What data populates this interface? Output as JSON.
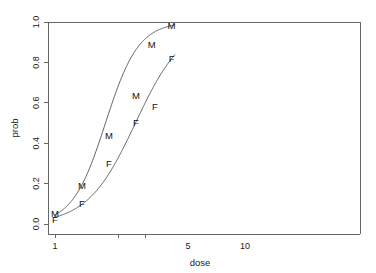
{
  "chart_data": {
    "type": "line",
    "title": "",
    "xlabel": "dose",
    "ylabel": "prob",
    "xscale": "log",
    "xlim": [
      0.88,
      22.5
    ],
    "ylim": [
      -0.04,
      1.04
    ],
    "grid": false,
    "legend": null,
    "xticks": [
      1,
      5,
      10
    ],
    "xtick_labels": [
      "1",
      "5",
      "10"
    ],
    "yticks": [
      0.0,
      0.2,
      0.4,
      0.6,
      0.8,
      1.0
    ],
    "ytick_labels": [
      "0.0",
      "0.2",
      "0.4",
      "0.6",
      "0.8",
      "1.0"
    ],
    "series": [
      {
        "name": "M",
        "marker_label": "M",
        "points": [
          {
            "x": 1,
            "y": 0.05
          },
          {
            "x": 2,
            "y": 0.19
          },
          {
            "x": 4,
            "y": 0.44
          },
          {
            "x": 8,
            "y": 0.635
          },
          {
            "x": 12,
            "y": 0.89
          },
          {
            "x": 20,
            "y": 0.98
          }
        ],
        "fit": {
          "model": "logistic",
          "intercept": -3.05,
          "slope": 2.35
        }
      },
      {
        "name": "F",
        "marker_label": "F",
        "points": [
          {
            "x": 1,
            "y": 0.02
          },
          {
            "x": 2,
            "y": 0.1
          },
          {
            "x": 4,
            "y": 0.3
          },
          {
            "x": 8,
            "y": 0.5
          },
          {
            "x": 13,
            "y": 0.58
          },
          {
            "x": 20,
            "y": 0.82
          }
        ],
        "fit": {
          "model": "logistic",
          "intercept": -3.35,
          "slope": 1.62
        }
      }
    ]
  },
  "axes": {
    "x_title": "dose",
    "y_title": "prob"
  },
  "labels": {
    "m": "M",
    "f": "F"
  }
}
